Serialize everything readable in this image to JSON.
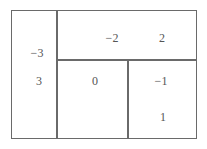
{
  "diagram": {
    "regions": [
      {
        "name": "left",
        "values": [
          "−3",
          "3"
        ]
      },
      {
        "name": "top-right",
        "values": [
          "−2",
          "2"
        ]
      },
      {
        "name": "bottom-middle",
        "values": [
          "0"
        ]
      },
      {
        "name": "bottom-right",
        "values": [
          "−1",
          "1"
        ]
      }
    ]
  }
}
